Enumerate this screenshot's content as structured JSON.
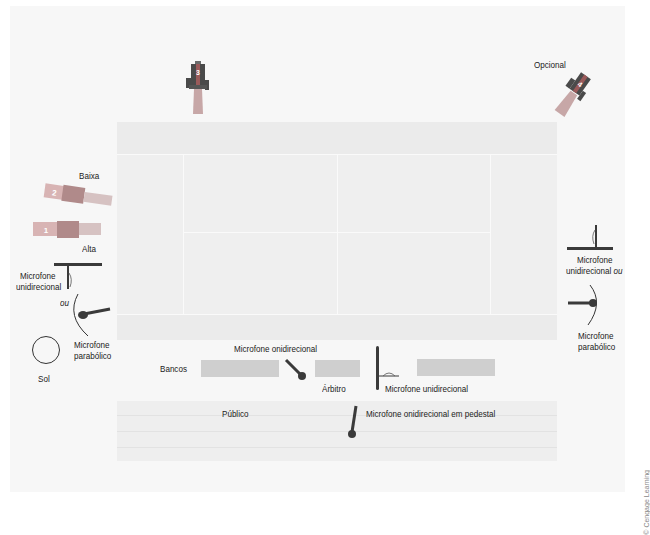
{
  "diagram": {
    "colors": {
      "background": "#f7f7f7",
      "court": "#efefef",
      "court_lines": "#fafafa",
      "bench": "#cfcfcf",
      "camera_dark": "#4a4a4a",
      "camera_accent": "#9a5a5a",
      "camera_light": "#c7a7a7",
      "mic": "#3a3a3a"
    },
    "cameras": [
      {
        "id": "1",
        "label": "Alta"
      },
      {
        "id": "2",
        "label": "Baixa"
      },
      {
        "id": "3",
        "label": ""
      },
      {
        "id": "4",
        "label": "Opcional"
      }
    ],
    "left_side": {
      "mic_uni_label_line1": "Microfone",
      "mic_uni_label_line2": "unidirecional",
      "or_label": "ou",
      "mic_para_label_line1": "Microfone",
      "mic_para_label_line2": "parabólico",
      "sun_label": "Sol"
    },
    "right_side": {
      "mic_uni_label_line1": "Microfone",
      "mic_uni_label_line2": "unidirecional",
      "or_label": "ou",
      "mic_para_label_line1": "Microfone",
      "mic_para_label_line2": "parabólico"
    },
    "sideline": {
      "benches_label": "Bancos",
      "omni_mic_label": "Microfone onidirecional",
      "referee_label": "Árbitro",
      "uni_mic_label": "Microfone unidirecional"
    },
    "audience": {
      "label": "Público",
      "stand_mic_label": "Microfone onidirecional em pedestal"
    },
    "credit": "© Cengage Learning"
  }
}
